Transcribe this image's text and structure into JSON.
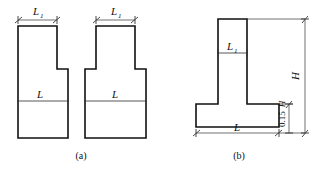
{
  "figure": {
    "type": "engineering-cross-section-diagram",
    "background_color": "#ffffff",
    "line_color": "#111111",
    "width": 326,
    "height": 173,
    "panels": [
      {
        "id": "a",
        "caption": "(a)",
        "description": "Two stepped column cross-sections, left asymmetric step and right symmetric step",
        "shapes": [
          {
            "name": "stepped-section-asymmetric",
            "top_dimension_label": "L",
            "top_dimension_subscript": "1",
            "mid_label": "L"
          },
          {
            "name": "stepped-section-symmetric",
            "top_dimension_label": "L",
            "top_dimension_subscript": "1",
            "mid_label": "L"
          }
        ]
      },
      {
        "id": "b",
        "caption": "(b)",
        "description": "Inverted T-shaped foundation cross-section with height dimensions",
        "shapes": [
          {
            "name": "tee-section",
            "stem_label": "L",
            "stem_subscript": "1",
            "base_dimension_label": "L",
            "total_height_label": "H",
            "flange_height_label": "0.15",
            "flange_height_symbol": "H"
          }
        ]
      }
    ]
  },
  "labels": {
    "L1": "L",
    "L1_sub": "1",
    "L": "L",
    "H": "H",
    "flange": "0.15",
    "flange_sym": "H",
    "caption_a": "(a)",
    "caption_b": "(b)"
  }
}
